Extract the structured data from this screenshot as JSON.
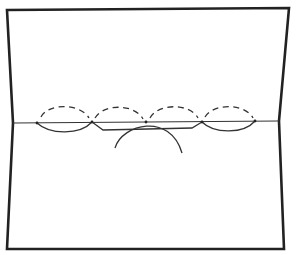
{
  "figure": {
    "stroke_color": "#222222",
    "background": "#ffffff",
    "nodes_x": [
      37,
      92,
      146,
      202,
      255
    ],
    "fold_y": 123,
    "dashed_arc_count": 4,
    "labels": []
  }
}
